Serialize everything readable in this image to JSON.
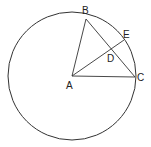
{
  "diagram": {
    "type": "geometry",
    "circle": {
      "center": "A",
      "cx": 72,
      "cy": 76,
      "r": 64
    },
    "points": {
      "A": {
        "label": "A",
        "x": 72,
        "y": 76
      },
      "B": {
        "label": "B",
        "x": 86,
        "y": 19
      },
      "C": {
        "label": "C",
        "x": 135,
        "y": 77
      },
      "D": {
        "label": "D",
        "x": 111,
        "y": 54
      },
      "E": {
        "label": "E",
        "x": 124,
        "y": 40
      }
    },
    "segments": [
      [
        "A",
        "B"
      ],
      [
        "A",
        "C"
      ],
      [
        "B",
        "C"
      ],
      [
        "A",
        "E"
      ]
    ],
    "stroke_color": "#333333"
  }
}
